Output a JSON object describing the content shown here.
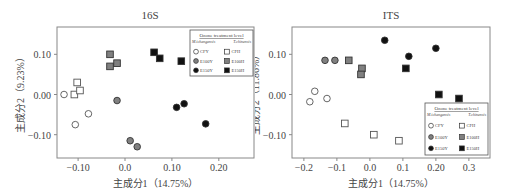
{
  "chart_data": [
    {
      "type": "scatter",
      "title": "16S",
      "xlabel": "主成分1（14.75%）",
      "ylabel": "主成分2（9.23%）",
      "xlim": [
        -0.145,
        0.275
      ],
      "ylim": [
        -0.158,
        0.168
      ],
      "xticks": [
        -0.1,
        0.0,
        0.1,
        0.2
      ],
      "xtick_labels": [
        "-0.10",
        "0.0",
        "0.10",
        "0.20"
      ],
      "yticks": [
        0.1,
        0.0,
        -0.1
      ],
      "ytick_labels": [
        "0.10",
        "0.00",
        "-0.10"
      ],
      "grid": false,
      "legend_position": "upper right",
      "legend": {
        "title": "Ozone treatment level",
        "group_left": "M.ichangensis",
        "group_right": "T.chinensis",
        "entries": [
          "CFY",
          "E100Y",
          "E150Y",
          "CFH",
          "E100H",
          "E150H"
        ]
      },
      "series": [
        {
          "name": "CFY",
          "marker": "circle",
          "fill": "#ffffff",
          "points": [
            [
              -0.13,
              0.0
            ],
            [
              -0.106,
              -0.075
            ],
            [
              -0.078,
              -0.048
            ]
          ]
        },
        {
          "name": "E100Y",
          "marker": "circle",
          "fill": "#808080",
          "points": [
            [
              -0.017,
              -0.015
            ],
            [
              0.011,
              -0.115
            ],
            [
              0.026,
              -0.13
            ]
          ]
        },
        {
          "name": "E150Y",
          "marker": "circle",
          "fill": "#111111",
          "points": [
            [
              0.11,
              -0.032
            ],
            [
              0.126,
              -0.023
            ],
            [
              0.172,
              -0.073
            ]
          ]
        },
        {
          "name": "CFH",
          "marker": "square",
          "fill": "#ffffff",
          "points": [
            [
              -0.108,
              0.0
            ],
            [
              -0.102,
              0.03
            ],
            [
              -0.096,
              0.01
            ]
          ]
        },
        {
          "name": "E100H",
          "marker": "square",
          "fill": "#808080",
          "points": [
            [
              -0.032,
              0.1
            ],
            [
              -0.032,
              0.07
            ],
            [
              -0.017,
              0.078
            ]
          ]
        },
        {
          "name": "E150H",
          "marker": "square",
          "fill": "#111111",
          "points": [
            [
              0.062,
              0.105
            ],
            [
              0.074,
              0.09
            ],
            [
              0.12,
              0.083
            ]
          ]
        }
      ]
    },
    {
      "type": "scatter",
      "title": "ITS",
      "xlabel": "主成分1（14.75%）",
      "ylabel": "主成分2（11.86%）",
      "xlim": [
        -0.236,
        0.364
      ],
      "ylim": [
        -0.158,
        0.168
      ],
      "xticks": [
        -0.2,
        -0.1,
        0.0,
        0.1,
        0.2,
        0.3
      ],
      "xtick_labels": [
        "-0.2",
        "-0.1",
        "0.0",
        "0.1",
        "0.20",
        "0.3"
      ],
      "yticks": [
        0.1,
        0.0,
        -0.1
      ],
      "ytick_labels": [
        "0.10",
        "0.00",
        "-0.10"
      ],
      "grid": false,
      "legend_position": "lower right",
      "legend": {
        "title": "Ozone treatment level",
        "group_left": "M.ichangensis",
        "group_right": "T.chinensis",
        "entries": [
          "CFY",
          "E100Y",
          "E150Y",
          "CFH",
          "E100H",
          "E150H"
        ]
      },
      "series": [
        {
          "name": "CFY",
          "marker": "circle",
          "fill": "#ffffff",
          "points": [
            [
              -0.182,
              -0.018
            ],
            [
              -0.167,
              0.008
            ],
            [
              -0.13,
              -0.01
            ]
          ]
        },
        {
          "name": "E100Y",
          "marker": "circle",
          "fill": "#808080",
          "points": [
            [
              -0.136,
              0.085
            ],
            [
              -0.106,
              0.085
            ]
          ]
        },
        {
          "name": "E150Y",
          "marker": "circle",
          "fill": "#111111",
          "points": [
            [
              0.045,
              0.135
            ],
            [
              0.118,
              0.095
            ],
            [
              0.2,
              0.115
            ]
          ]
        },
        {
          "name": "CFH",
          "marker": "square",
          "fill": "#ffffff",
          "points": [
            [
              -0.076,
              -0.072
            ],
            [
              0.012,
              -0.1
            ],
            [
              0.088,
              -0.115
            ]
          ]
        },
        {
          "name": "E100H",
          "marker": "square",
          "fill": "#808080",
          "points": [
            [
              -0.064,
              0.085
            ],
            [
              -0.024,
              0.065
            ],
            [
              -0.027,
              0.05
            ]
          ]
        },
        {
          "name": "E150H",
          "marker": "square",
          "fill": "#111111",
          "points": [
            [
              0.109,
              0.065
            ],
            [
              0.209,
              0.0
            ],
            [
              0.27,
              -0.01
            ]
          ]
        }
      ]
    }
  ]
}
